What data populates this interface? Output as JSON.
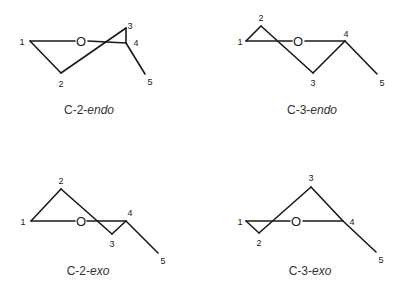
{
  "figure": {
    "background": "#ffffff",
    "line_color": "#1a1a1a",
    "panels": [
      {
        "id": "c2-endo",
        "caption_prefix": "C-2-",
        "caption_italic": "endo",
        "ring_oxygen": "O",
        "atom_labels": {
          "c1": "1",
          "c2": "2",
          "c3": "3",
          "c4": "4",
          "c5": "5"
        }
      },
      {
        "id": "c3-endo",
        "caption_prefix": "C-3-",
        "caption_italic": "endo",
        "ring_oxygen": "O",
        "atom_labels": {
          "c1": "1",
          "c2": "2",
          "c3": "3",
          "c4": "4",
          "c5": "5"
        }
      },
      {
        "id": "c2-exo",
        "caption_prefix": "C-2-",
        "caption_italic": "exo",
        "ring_oxygen": "O",
        "atom_labels": {
          "c1": "1",
          "c2": "2",
          "c3": "3",
          "c4": "4",
          "c5": "5"
        }
      },
      {
        "id": "c3-exo",
        "caption_prefix": "C-3-",
        "caption_italic": "exo",
        "ring_oxygen": "O",
        "atom_labels": {
          "c1": "1",
          "c2": "2",
          "c3": "3",
          "c4": "4",
          "c5": "5"
        }
      }
    ]
  }
}
